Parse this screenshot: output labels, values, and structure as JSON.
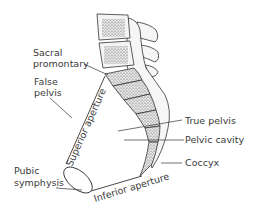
{
  "diagram": {
    "labels": {
      "sacral_promontory_line1": "Sacral",
      "sacral_promontory_line2": "promontary",
      "false_pelvis_line1": "False",
      "false_pelvis_line2": "pelvis",
      "superior_aperture": "Superior aperture",
      "pubic_symphysis_line1": "Pubic",
      "pubic_symphysis_line2": "symphysis",
      "inferior_aperture": "Inferior aperture",
      "true_pelvis": "True pelvis",
      "pelvic_cavity": "Pelvic cavity",
      "coccyx": "Coccyx"
    },
    "colors": {
      "line": "#333333",
      "text": "#3a3a3a",
      "bone_fill": "#f2f2f2",
      "stipple": "#6a6a6a"
    }
  }
}
